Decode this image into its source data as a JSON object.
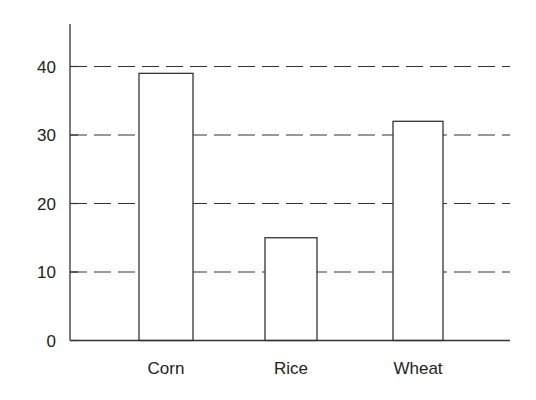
{
  "chart_data": {
    "type": "bar",
    "title": "",
    "xlabel": "",
    "ylabel": "",
    "categories": [
      "Corn",
      "Rice",
      "Wheat"
    ],
    "values": [
      39,
      15,
      32
    ],
    "ylim": [
      0,
      45
    ],
    "yticks": [
      0,
      10,
      20,
      30,
      40
    ],
    "grid": {
      "y": true,
      "style": "dashed"
    },
    "legend": null,
    "bar_fill": "#ffffff",
    "bar_stroke": "#333333"
  }
}
